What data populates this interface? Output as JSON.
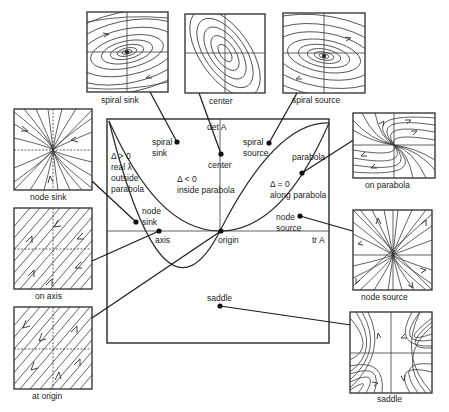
{
  "figure": {
    "axes": {
      "x_label": "tr A",
      "y_label": "det A"
    },
    "regions": {
      "outside": [
        "Δ > 0",
        "real λ",
        "outside",
        "parabola"
      ],
      "inside": [
        "Δ < 0",
        "inside parabola"
      ],
      "along": [
        "Δ = 0",
        "along parabola"
      ]
    },
    "points": [
      {
        "id": "spiral-sink",
        "label_lines": [
          "spiral",
          "sink"
        ]
      },
      {
        "id": "center",
        "label_lines": [
          "center"
        ]
      },
      {
        "id": "spiral-source",
        "label_lines": [
          "spiral",
          "source"
        ]
      },
      {
        "id": "parabola",
        "label_lines": [
          "parabola"
        ]
      },
      {
        "id": "node-sink",
        "label_lines": [
          "node",
          "sink"
        ]
      },
      {
        "id": "node-source",
        "label_lines": [
          "node",
          "source"
        ]
      },
      {
        "id": "axis",
        "label_lines": [
          "axis"
        ]
      },
      {
        "id": "origin",
        "label_lines": [
          "origin"
        ]
      },
      {
        "id": "saddle",
        "label_lines": [
          "saddle"
        ]
      }
    ],
    "phase_portraits": [
      {
        "id": "spiral-sink",
        "caption": "spiral sink"
      },
      {
        "id": "center",
        "caption": "center"
      },
      {
        "id": "spiral-source",
        "caption": "spiral source"
      },
      {
        "id": "node-sink",
        "caption": "node sink"
      },
      {
        "id": "on-axis",
        "caption": "on axis"
      },
      {
        "id": "at-origin",
        "caption": "at origin"
      },
      {
        "id": "on-parabola",
        "caption": "on parabola"
      },
      {
        "id": "node-source",
        "caption": "node source"
      },
      {
        "id": "saddle",
        "caption": "saddle"
      }
    ]
  }
}
